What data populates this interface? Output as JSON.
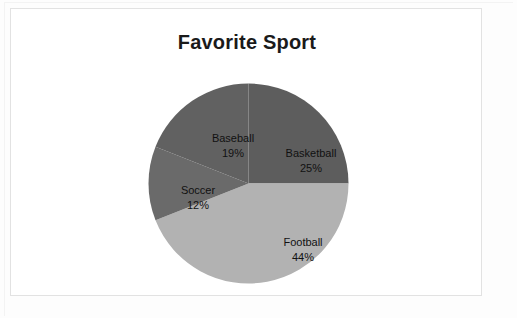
{
  "card": {
    "title": "Favorite Sport"
  },
  "chart_data": {
    "type": "pie",
    "title": "Favorite Sport",
    "xlabel": "",
    "ylabel": "",
    "legend": "none",
    "grid": false,
    "start_angle_deg": 0,
    "direction": "clockwise",
    "categories": [
      "Basketball",
      "Football",
      "Soccer",
      "Baseball"
    ],
    "values": [
      25,
      44,
      12,
      19
    ],
    "value_unit": "%",
    "slices": [
      {
        "label": "Basketball",
        "value": 25,
        "value_text": "25%",
        "color": "#5d5d5d",
        "start_deg": 0,
        "end_deg": 90,
        "label_x": 300,
        "label_y": 145
      },
      {
        "label": "Football",
        "value": 44,
        "value_text": "44%",
        "color": "#b2b2b2",
        "start_deg": 90,
        "end_deg": 248.4,
        "label_x": 292,
        "label_y": 234
      },
      {
        "label": "Soccer",
        "value": 12,
        "value_text": "12%",
        "color": "#6a6a6a",
        "start_deg": 248.4,
        "end_deg": 291.6,
        "label_x": 187,
        "label_y": 182
      },
      {
        "label": "Baseball",
        "value": 19,
        "value_text": "19%",
        "color": "#616161",
        "start_deg": 291.6,
        "end_deg": 360,
        "label_x": 222,
        "label_y": 130
      }
    ]
  }
}
